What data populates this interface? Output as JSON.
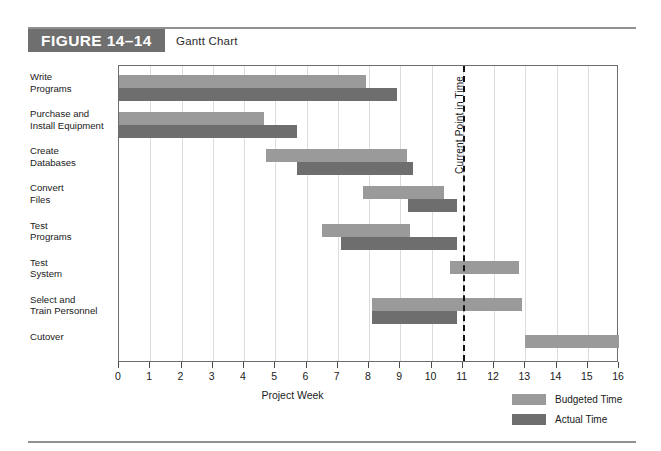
{
  "figure": {
    "badge_label": "FIGURE 14–14",
    "title": "Gantt Chart"
  },
  "legend": {
    "position": "bottom-right",
    "items": [
      {
        "label": "Budgeted Time",
        "color": "#9a9a9a",
        "key": "budgeted"
      },
      {
        "label": "Actual Time",
        "color": "#6e6e6e",
        "key": "actual"
      }
    ]
  },
  "annotation": {
    "current_point_label": "Current Point in Time",
    "current_point_week": 11
  },
  "chart_data": {
    "type": "bar",
    "orientation": "horizontal",
    "subtype": "gantt",
    "title": "Gantt Chart",
    "xlabel": "Project Week",
    "ylabel": "",
    "xlim": [
      0,
      16
    ],
    "xticks": [
      0,
      1,
      2,
      3,
      4,
      5,
      6,
      7,
      8,
      9,
      10,
      11,
      12,
      13,
      14,
      15,
      16
    ],
    "xtick_labels": [
      "0",
      "1",
      "2",
      "3",
      "4",
      "5",
      "6",
      "7",
      "8",
      "9",
      "10",
      "11",
      "12",
      "13",
      "14",
      "15",
      "16"
    ],
    "grid": "vertical-dotted",
    "legend_position": "bottom-right",
    "annotations": [
      {
        "text": "Current Point in Time",
        "x": 11,
        "style": "dashed-vertical-line"
      }
    ],
    "categories": [
      "Write Programs",
      "Purchase and Install Equipment",
      "Create Databases",
      "Convert Files",
      "Test Programs",
      "Test System",
      "Select and Train Personnel",
      "Cutover"
    ],
    "series": [
      {
        "name": "Budgeted Time",
        "color": "#9a9a9a",
        "bars": [
          {
            "task": "Write Programs",
            "start": 0,
            "end": 7.9
          },
          {
            "task": "Purchase and Install Equipment",
            "start": 0,
            "end": 4.65
          },
          {
            "task": "Create Databases",
            "start": 4.7,
            "end": 9.2
          },
          {
            "task": "Convert Files",
            "start": 7.8,
            "end": 10.4
          },
          {
            "task": "Test Programs",
            "start": 6.5,
            "end": 9.3
          },
          {
            "task": "Test System",
            "start": 10.6,
            "end": 12.8
          },
          {
            "task": "Select and Train Personnel",
            "start": 8.1,
            "end": 12.9
          },
          {
            "task": "Cutover",
            "start": 13.0,
            "end": 16.0
          }
        ]
      },
      {
        "name": "Actual Time",
        "color": "#6e6e6e",
        "bars": [
          {
            "task": "Write Programs",
            "start": 0,
            "end": 8.9
          },
          {
            "task": "Purchase and Install Equipment",
            "start": 0,
            "end": 5.7
          },
          {
            "task": "Create Databases",
            "start": 5.7,
            "end": 9.4
          },
          {
            "task": "Convert Files",
            "start": 9.25,
            "end": 10.8
          },
          {
            "task": "Test Programs",
            "start": 7.1,
            "end": 10.8
          },
          {
            "task": "Select and Train Personnel",
            "start": 8.1,
            "end": 10.8
          }
        ]
      }
    ]
  },
  "task_labels": [
    {
      "line1": "Write",
      "line2": "Programs"
    },
    {
      "line1": "Purchase and",
      "line2": "Install Equipment"
    },
    {
      "line1": "Create",
      "line2": "Databases"
    },
    {
      "line1": "Convert",
      "line2": "Files"
    },
    {
      "line1": "Test",
      "line2": "Programs"
    },
    {
      "line1": "Test",
      "line2": "System"
    },
    {
      "line1": "Select and",
      "line2": "Train Personnel"
    },
    {
      "line1": "Cutover",
      "line2": ""
    }
  ]
}
